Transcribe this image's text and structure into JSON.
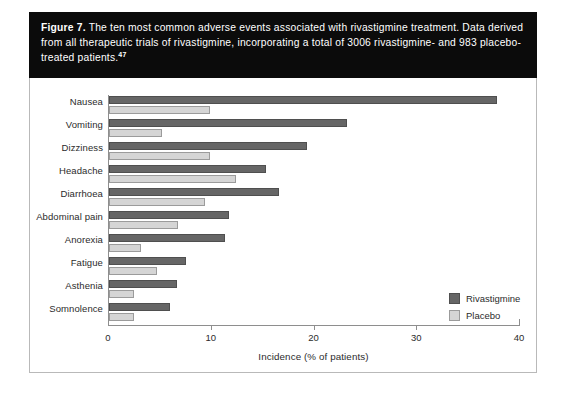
{
  "caption": {
    "figure_label": "Figure 7.",
    "text": " The ten most common adverse events associated with rivastigmine treatment. Data derived from all therapeutic trials of rivastigmine, incorporating a total of 3006 rivastigmine- and 983 placebo-treated patients.",
    "reference_superscript": "47"
  },
  "colors": {
    "rivastigmine": "#666666",
    "placebo": "#d5d5d5",
    "caption_background": "#0b0b0b",
    "caption_text": "#ffffff",
    "axis": "#8e8e8e",
    "panel_border": "#b9b9b9"
  },
  "chart_data": {
    "type": "bar",
    "orientation": "horizontal",
    "title": "",
    "subtitle": "",
    "xlabel": "Incidence (% of patients)",
    "ylabel": "",
    "xlim": [
      0,
      40
    ],
    "xticks": [
      0,
      10,
      20,
      30,
      40
    ],
    "xtick_labels": [
      "0",
      "10",
      "20",
      "30",
      "40"
    ],
    "grid": false,
    "legend_position": "inside-right",
    "categories": [
      "Nausea",
      "Vomiting",
      "Dizziness",
      "Headache",
      "Diarrhoea",
      "Abdominal pain",
      "Anorexia",
      "Fatigue",
      "Asthenia",
      "Somnolence"
    ],
    "series": [
      {
        "name": "Rivastigmine",
        "color": "#666666",
        "values": [
          37.8,
          23.2,
          19.3,
          15.3,
          16.5,
          11.7,
          11.3,
          7.5,
          6.6,
          5.9
        ]
      },
      {
        "name": "Placebo",
        "color": "#d5d5d5",
        "values": [
          9.8,
          5.2,
          9.8,
          12.4,
          9.3,
          6.7,
          3.1,
          4.7,
          2.4,
          2.4
        ]
      }
    ]
  }
}
